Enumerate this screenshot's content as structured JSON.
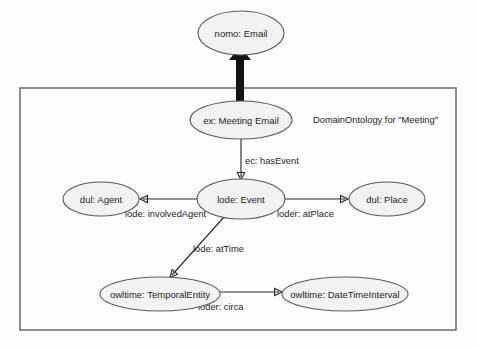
{
  "diagram": {
    "type": "ontology-graph",
    "boundary": {
      "label": "DomainOntology for \"Meeting\"",
      "x": 20,
      "y": 88,
      "width": 436,
      "height": 242,
      "stroke": "#5d5d5f"
    },
    "colors": {
      "node_fill": "#f2f2f2",
      "node_stroke": "#59595b",
      "edge_stroke": "#2b2b2b",
      "text": "#1d1d1b",
      "thick_arrow": "#141414",
      "background": "#fdfdfd"
    },
    "nodes": [
      {
        "id": "email",
        "label": "nomo: Email",
        "cx": 241,
        "cy": 33,
        "rx": 43,
        "ry": 22
      },
      {
        "id": "meeting_email",
        "label": "ex: Meeting Email",
        "cx": 241,
        "cy": 120,
        "rx": 51,
        "ry": 19
      },
      {
        "id": "event",
        "label": "lode: Event",
        "cx": 241,
        "cy": 199,
        "rx": 44,
        "ry": 20
      },
      {
        "id": "agent",
        "label": "dul: Agent",
        "cx": 101,
        "cy": 199,
        "rx": 38,
        "ry": 17
      },
      {
        "id": "place",
        "label": "dul: Place",
        "cx": 387,
        "cy": 199,
        "rx": 38,
        "ry": 17
      },
      {
        "id": "temporal_entity",
        "label": "owltime: TemporalEntity",
        "cx": 160,
        "cy": 294,
        "rx": 60,
        "ry": 17
      },
      {
        "id": "datetime_interval",
        "label": "owltime: DateTimeInterval",
        "cx": 345,
        "cy": 294,
        "rx": 63,
        "ry": 17
      }
    ],
    "edges": [
      {
        "id": "has_event",
        "label": "ec: hasEvent",
        "from": "meeting_email",
        "to": "event",
        "label_x": 245,
        "label_y": 164
      },
      {
        "id": "involved_agent",
        "label": "lode: involvedAgent",
        "from": "event",
        "to": "agent",
        "label_x": 125,
        "label_y": 217
      },
      {
        "id": "at_place",
        "label": "loder: atPlace",
        "from": "event",
        "to": "place",
        "label_x": 277,
        "label_y": 217
      },
      {
        "id": "at_time",
        "label": "lode: atTime",
        "from": "event",
        "to": "temporal_entity",
        "label_x": 193,
        "label_y": 252
      },
      {
        "id": "circa",
        "label": "loder: circa",
        "from": "temporal_entity",
        "to": "datetime_interval",
        "label_x": 198,
        "label_y": 310
      }
    ],
    "thick_arrow": {
      "id": "subclass-arrow",
      "from": "meeting_email",
      "to": "email",
      "direction": "up"
    }
  }
}
